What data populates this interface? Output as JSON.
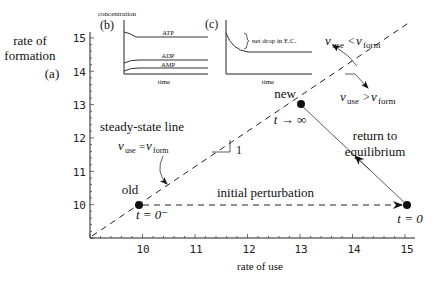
{
  "chart_data": {
    "type": "line",
    "title": "",
    "xlabel": "rate of use",
    "ylabel": "rate of formation",
    "xlim": [
      9,
      15.3
    ],
    "ylim": [
      9,
      15.3
    ],
    "x_ticks": [
      "10",
      "11",
      "12",
      "13",
      "14",
      "15"
    ],
    "y_ticks": [
      "15",
      "14",
      "13",
      "12",
      "11",
      "10"
    ],
    "panel_label": "(a)",
    "series": [
      {
        "name": "steady-state line",
        "style": "dashed",
        "points": [
          [
            9,
            9
          ],
          [
            15.3,
            15.3
          ]
        ]
      },
      {
        "name": "initial perturbation",
        "style": "dashed-arrow",
        "points": [
          [
            9.95,
            10
          ],
          [
            15,
            10
          ]
        ]
      },
      {
        "name": "return to equilibrium",
        "style": "solid-arrow",
        "points": [
          [
            15,
            10
          ],
          [
            13,
            13
          ]
        ]
      }
    ],
    "points": [
      {
        "label": "old",
        "time": "t = 0⁻",
        "x": 9.95,
        "y": 10
      },
      {
        "label": "new",
        "time": "t → ∞",
        "x": 13,
        "y": 13
      },
      {
        "label": "",
        "time": "t = 0",
        "x": 15,
        "y": 10
      }
    ],
    "annotations": {
      "steady_state": "steady-state line",
      "equality": "v_use = v_form",
      "slope": "1",
      "perturbation": "initial perturbation",
      "return": [
        "return to",
        "equilibrium"
      ],
      "above": "v_use < v_form",
      "below": "v_use > v_form"
    },
    "insets": [
      {
        "label": "(b)",
        "ylabel": "concentration",
        "xlabel": "time",
        "series": [
          "ATP",
          "ADP",
          "AMP"
        ]
      },
      {
        "label": "(c)",
        "xlabel": "time",
        "annotation": "net drop in E.C."
      }
    ]
  }
}
